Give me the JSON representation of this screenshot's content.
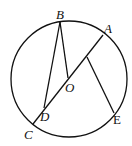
{
  "diagram": {
    "type": "geometry-circle",
    "circle": {
      "center": "O",
      "cx": 69,
      "cy": 79,
      "r": 58
    },
    "points": {
      "A": {
        "label": "A",
        "x": 103,
        "y": 35
      },
      "B": {
        "label": "B",
        "x": 60,
        "y": 22
      },
      "C": {
        "label": "C",
        "x": 33,
        "y": 124
      },
      "D": {
        "label": "D",
        "x": 44,
        "y": 108
      },
      "E": {
        "label": "E",
        "x": 114,
        "y": 113
      },
      "O": {
        "label": "O",
        "x": 68,
        "y": 78
      },
      "F": {
        "x": 87,
        "y": 57
      }
    },
    "segments": [
      "AC",
      "BD",
      "BO",
      "FE"
    ],
    "labels": {
      "A": "A",
      "B": "B",
      "C": "C",
      "D": "D",
      "E": "E",
      "O": "O"
    }
  }
}
